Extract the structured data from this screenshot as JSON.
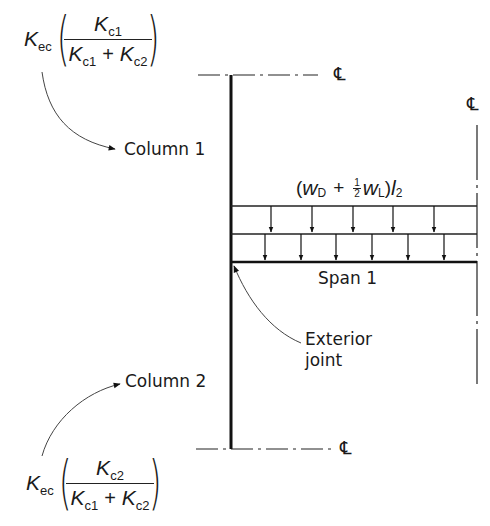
{
  "figure": {
    "type": "structural frame diagram - exterior joint distribution",
    "column_1": {
      "label": "Column 1",
      "stiffness_formula": {
        "prefix": "K",
        "prefix_sub": "ec",
        "numerator": "K",
        "numerator_sub": "c1",
        "denominator_a": "K",
        "denominator_a_sub": "c1",
        "plus": "+",
        "denominator_b": "K",
        "denominator_b_sub": "c2"
      }
    },
    "column_2": {
      "label": "Column 2",
      "stiffness_formula": {
        "prefix": "K",
        "prefix_sub": "ec",
        "numerator": "K",
        "numerator_sub": "c2",
        "denominator_a": "K",
        "denominator_a_sub": "c1",
        "plus": "+",
        "denominator_b": "K",
        "denominator_b_sub": "c2"
      }
    },
    "load": {
      "open": "(",
      "w_dead": "w",
      "w_dead_sub": "D",
      "plus": "+",
      "half_num": "1",
      "half_den": "2",
      "w_live": "w",
      "w_live_sub": "L",
      "close": ")",
      "l": "l",
      "l_sub": "2"
    },
    "span_label": "Span 1",
    "joint_label_line1": "Exterior",
    "joint_label_line2": "joint",
    "centerline_symbol": "℄",
    "colors": {
      "ink": "#1a1a1a",
      "background": "#ffffff"
    }
  }
}
